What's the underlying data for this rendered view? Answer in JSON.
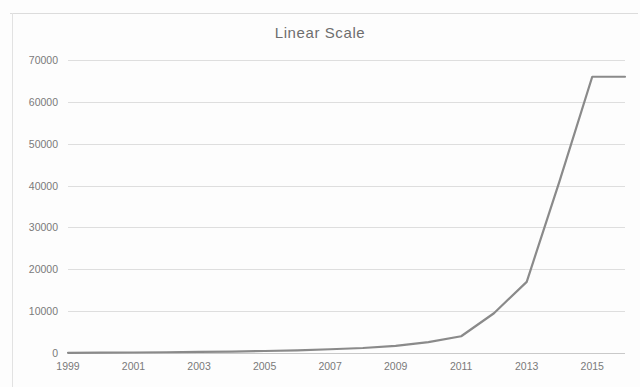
{
  "chart_data": {
    "type": "line",
    "title": "Linear Scale",
    "xlabel": "",
    "ylabel": "",
    "grid": "horizontal",
    "legend": "none",
    "xlim": [
      1999,
      2016
    ],
    "ylim": [
      0,
      70000
    ],
    "y_ticks": [
      "0",
      "10000",
      "20000",
      "30000",
      "40000",
      "50000",
      "60000",
      "70000"
    ],
    "y_tick_values": [
      0,
      10000,
      20000,
      30000,
      40000,
      50000,
      60000,
      70000
    ],
    "x_ticks": [
      "1999",
      "2001",
      "2003",
      "2005",
      "2007",
      "2009",
      "2011",
      "2013",
      "2015"
    ],
    "x_tick_values": [
      1999,
      2001,
      2003,
      2005,
      2007,
      2009,
      2011,
      2013,
      2015
    ],
    "series": [
      {
        "name": "value",
        "color": "#8a8a8a",
        "x": [
          1999,
          2000,
          2001,
          2002,
          2003,
          2004,
          2005,
          2006,
          2007,
          2008,
          2009,
          2010,
          2011,
          2012,
          2013,
          2014,
          2015,
          2016
        ],
        "values": [
          50,
          80,
          120,
          180,
          250,
          350,
          480,
          650,
          900,
          1200,
          1700,
          2600,
          4000,
          9500,
          17000,
          41000,
          66000,
          66000
        ]
      }
    ]
  },
  "figure": {
    "title": "Linear Scale",
    "line_color": "#8a8a8a",
    "grid_color": "#d8d8d8",
    "text_color": "#7a7a7a"
  }
}
